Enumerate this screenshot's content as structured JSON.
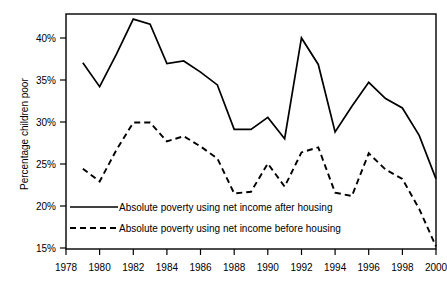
{
  "chart_data": {
    "type": "line",
    "title": "",
    "xlabel": "",
    "ylabel": "Percentage children poor",
    "xlim": [
      1978,
      2000
    ],
    "ylim": [
      15,
      42.5
    ],
    "grid": false,
    "legend_position": "inside-bottom-left",
    "x_tick_labels": [
      "1978",
      "1980",
      "1982",
      "1984",
      "1986",
      "1988",
      "1990",
      "1992",
      "1994",
      "1996",
      "1998",
      "2000"
    ],
    "x_ticks": [
      1978,
      1980,
      1982,
      1984,
      1986,
      1988,
      1990,
      1992,
      1994,
      1996,
      1998,
      2000
    ],
    "y_tick_labels": [
      "15%",
      "20%",
      "25%",
      "30%",
      "35%",
      "40%"
    ],
    "y_ticks": [
      15,
      20,
      25,
      30,
      35,
      40
    ],
    "x": [
      1979,
      1980,
      1981,
      1982,
      1983,
      1984,
      1985,
      1986,
      1987,
      1988,
      1989,
      1990,
      1991,
      1992,
      1993,
      1994,
      1995,
      1996,
      1997,
      1998,
      1999,
      2000
    ],
    "series": [
      {
        "name": "Absolute poverty using net income after housing",
        "style": "solid",
        "color": "#000000",
        "values": [
          36.8,
          34.0,
          37.8,
          41.9,
          41.3,
          36.7,
          37.0,
          35.7,
          34.2,
          29.0,
          29.0,
          30.4,
          27.9,
          39.7,
          36.6,
          28.7,
          31.7,
          34.5,
          32.6,
          31.5,
          28.3,
          23.2
        ]
      },
      {
        "name": "Absolute poverty using net income before housing",
        "style": "dashed",
        "color": "#000000",
        "values": [
          24.4,
          22.9,
          26.6,
          29.8,
          29.8,
          27.6,
          28.2,
          27.0,
          25.6,
          21.5,
          21.7,
          25.0,
          22.3,
          26.3,
          26.9,
          21.6,
          21.2,
          26.2,
          24.3,
          23.2,
          19.7,
          15.3
        ]
      }
    ],
    "legend": [
      {
        "label": "Absolute poverty using net income after housing",
        "style": "solid"
      },
      {
        "label": "Absolute poverty using net income before housing",
        "style": "dashed"
      }
    ]
  }
}
